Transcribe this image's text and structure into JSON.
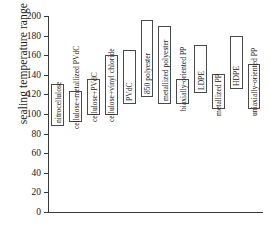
{
  "chart_data": {
    "type": "bar",
    "title": "",
    "xlabel": "",
    "ylabel": "sealing temperature range (°C)",
    "ylim": [
      0,
      200
    ],
    "yticks": [
      0,
      20,
      40,
      60,
      80,
      100,
      120,
      140,
      160,
      180,
      200
    ],
    "ytick_labels": [
      "0",
      "20",
      "40",
      "60",
      "80",
      "100",
      "120",
      "140",
      "160",
      "180",
      "200"
    ],
    "grid": false,
    "legend": null,
    "bar_style": "floating range bars (open rectangles, no fill)",
    "units": "°C",
    "categories": [
      "nitrocellulose",
      "cellulose+metallized PVdC",
      "cellulose+PVdC",
      "cellulose+vinyl chloride",
      "PVdC",
      "850 polyester",
      "metallized polyester",
      "biaxially-oriented PP",
      "LDPE",
      "metallized PP",
      "HDPE",
      "uniaxially-oriented PP"
    ],
    "ranges": [
      {
        "label": "nitrocellulose",
        "low": 88,
        "high": 131
      },
      {
        "label": "cellulose+metallized PVdC",
        "low": 92,
        "high": 123
      },
      {
        "label": "cellulose+PVdC",
        "low": 99,
        "high": 136
      },
      {
        "label": "cellulose+vinyl chloride",
        "low": 99,
        "high": 160
      },
      {
        "label": "PVdC",
        "low": 110,
        "high": 165
      },
      {
        "label": "850 polyester",
        "low": 117,
        "high": 196
      },
      {
        "label": "metallized polyester",
        "low": 110,
        "high": 190
      },
      {
        "label": "biaxially-oriented PP",
        "low": 110,
        "high": 136
      },
      {
        "label": "LDPE",
        "low": 121,
        "high": 170
      },
      {
        "label": "metallized PP",
        "low": 105,
        "high": 141
      },
      {
        "label": "HDPE",
        "low": 126,
        "high": 180
      },
      {
        "label": "uniaxially-oriented PP",
        "low": 105,
        "high": 151
      }
    ]
  },
  "axis": {
    "y_title": "sealing temperature range (°C)"
  }
}
